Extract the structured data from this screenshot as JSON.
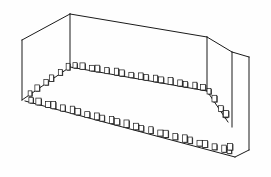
{
  "figure": {
    "style": "black-and-white technical line art",
    "background_color": "#fefefe",
    "line_color": "#1a1a1a",
    "marker_fill_color": "#ffffff",
    "marker_shadow_color": "#2b2b2b",
    "canvas": {
      "width": 271,
      "height": 177
    },
    "projection": "two-point perspective",
    "line_weight_px": 1
  },
  "geometry": {
    "vertices": {
      "top_back_apex": {
        "x": 70,
        "y": 14
      },
      "top_left_front": {
        "x": 22,
        "y": 40
      },
      "top_right_back": {
        "x": 207,
        "y": 37
      },
      "top_right_outer": {
        "x": 232,
        "y": 52
      },
      "far_right_top": {
        "x": 249,
        "y": 57
      },
      "left_lower_front": {
        "x": 22,
        "y": 100
      },
      "ledge_left_corner": {
        "x": 70,
        "y": 67
      },
      "ledge_right_turn": {
        "x": 207,
        "y": 91
      },
      "ledge_right_drop": {
        "x": 228,
        "y": 122
      },
      "floor_left_corner": {
        "x": 25,
        "y": 101
      },
      "floor_right_corner": {
        "x": 235,
        "y": 157
      },
      "far_right_bottom": {
        "x": 249,
        "y": 150
      },
      "right_panel_bottom": {
        "x": 232,
        "y": 127
      }
    },
    "edges": [
      {
        "name": "roof-left-ridge",
        "from": "top_left_front",
        "to": "top_back_apex"
      },
      {
        "name": "roof-back-ridge",
        "from": "top_back_apex",
        "to": "top_right_back"
      },
      {
        "name": "roof-right-slope",
        "from": "top_right_back",
        "to": "top_right_outer"
      },
      {
        "name": "roof-far-right-edge",
        "from": "top_right_outer",
        "to": "far_right_top"
      },
      {
        "name": "wall-left-vertical",
        "from": "top_left_front",
        "to": "left_lower_front"
      },
      {
        "name": "post-back-left",
        "from": "top_back_apex",
        "to": "ledge_left_corner"
      },
      {
        "name": "post-back-right",
        "from": "top_right_back",
        "to": "ledge_right_turn"
      },
      {
        "name": "panel-right-outer",
        "from": "top_right_outer",
        "to": "right_panel_bottom"
      },
      {
        "name": "panel-far-right-outer",
        "from": "far_right_top",
        "to": "far_right_bottom"
      },
      {
        "name": "ledge-left-run",
        "from": "left_lower_front",
        "to": "ledge_left_corner"
      },
      {
        "name": "ledge-back-run",
        "from": "ledge_left_corner",
        "to": "ledge_right_turn"
      },
      {
        "name": "ledge-right-drop",
        "from": "ledge_right_turn",
        "to": "ledge_right_drop"
      },
      {
        "name": "floor-front-run",
        "from": "floor_left_corner",
        "to": "floor_right_corner"
      },
      {
        "name": "floor-right-close",
        "from": "floor_right_corner",
        "to": "far_right_bottom"
      }
    ],
    "marker_rows": [
      {
        "name": "upper-ledge-left-segment",
        "start": {
          "x": 30,
          "y": 96
        },
        "end": {
          "x": 68,
          "y": 70
        },
        "count": 6,
        "marker_w": 4.2,
        "marker_h": 6.0
      },
      {
        "name": "upper-ledge-back-segment",
        "start": {
          "x": 75,
          "y": 68
        },
        "end": {
          "x": 203,
          "y": 90
        },
        "count": 17,
        "marker_w": 4.6,
        "marker_h": 6.2
      },
      {
        "name": "upper-ledge-right-drop-segment",
        "start": {
          "x": 209,
          "y": 94
        },
        "end": {
          "x": 226,
          "y": 119
        },
        "count": 4,
        "marker_w": 4.4,
        "marker_h": 6.4
      },
      {
        "name": "lower-floor-front-row",
        "start": {
          "x": 31,
          "y": 103
        },
        "end": {
          "x": 231,
          "y": 154
        },
        "count": 26,
        "marker_w": 4.8,
        "marker_h": 6.6
      }
    ],
    "corner_markers": [
      {
        "name": "corner-marker-right-ledge",
        "x": 226,
        "y": 117,
        "w": 5.0,
        "h": 6.5
      },
      {
        "name": "corner-marker-right-floor",
        "x": 230,
        "y": 150,
        "w": 5.0,
        "h": 6.5
      }
    ]
  }
}
